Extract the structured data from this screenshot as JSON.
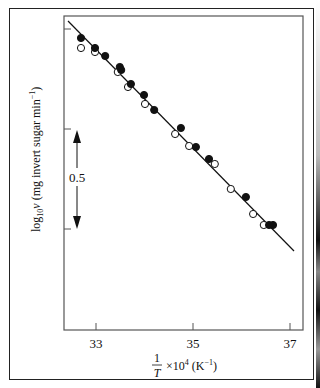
{
  "chart_data": {
    "type": "scatter",
    "title": "",
    "xlabel": "1/T ×10^4 (K^-1)",
    "ylabel": "log10 v (mg invert sugar min^-1)",
    "x_ticks": [
      33,
      35,
      37
    ],
    "xlim": [
      32.4,
      37.9
    ],
    "y_ticks_unlabeled": 3,
    "y_scale_annotation": "0.5",
    "y_units_note": "y values relative; arrow spans 0.5 log units between ticks",
    "ylim_relative": [
      -0.5,
      1.07
    ],
    "grid": false,
    "legend": null,
    "series": [
      {
        "name": "filled circles",
        "marker": "filled-circle",
        "points": [
          [
            32.69,
            0.955
          ],
          [
            32.98,
            0.905
          ],
          [
            33.19,
            0.865
          ],
          [
            33.49,
            0.81
          ],
          [
            33.52,
            0.795
          ],
          [
            33.72,
            0.725
          ],
          [
            33.99,
            0.67
          ],
          [
            34.2,
            0.595
          ],
          [
            34.75,
            0.505
          ],
          [
            35.06,
            0.41
          ],
          [
            35.33,
            0.35
          ],
          [
            36.09,
            0.16
          ],
          [
            36.57,
            0.02
          ],
          [
            36.65,
            0.02
          ]
        ]
      },
      {
        "name": "open circles",
        "marker": "open-circle",
        "points": [
          [
            32.69,
            0.905
          ],
          [
            32.98,
            0.885
          ],
          [
            33.45,
            0.785
          ],
          [
            33.66,
            0.71
          ],
          [
            34.01,
            0.625
          ],
          [
            34.63,
            0.475
          ],
          [
            34.92,
            0.415
          ],
          [
            35.45,
            0.325
          ],
          [
            35.78,
            0.2
          ],
          [
            36.24,
            0.075
          ],
          [
            36.46,
            0.02
          ]
        ]
      },
      {
        "name": "fit line",
        "marker": "line",
        "points": [
          [
            32.42,
            1.04
          ],
          [
            37.08,
            -0.11
          ]
        ]
      }
    ]
  },
  "labels": {
    "x_tick_33": "33",
    "x_tick_35": "35",
    "x_tick_37": "37",
    "scale_value": "0.5",
    "x_axis_frac_num": "1",
    "x_axis_frac_den": "T",
    "x_axis_rest": "×10",
    "x_axis_exp": "4",
    "x_axis_units_open": " (K",
    "x_axis_units_exp": "−1",
    "x_axis_units_close": ")",
    "y_axis_log": "log",
    "y_axis_sub": "10",
    "y_axis_var": "v",
    "y_axis_units": " (mg invert sugar min",
    "y_axis_units_exp": "−1",
    "y_axis_units_close": ")"
  }
}
